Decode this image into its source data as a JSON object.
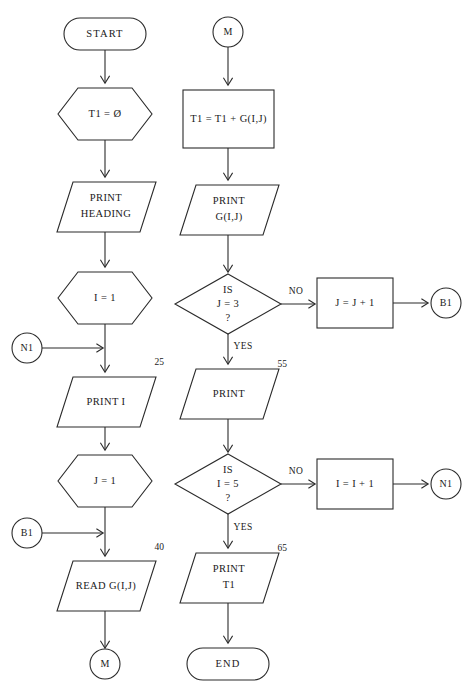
{
  "diagram": {
    "type": "flowchart",
    "title": "",
    "orientation": "two-column",
    "colors": {
      "stroke": "#2b2b2b",
      "fill": "#ffffff",
      "text": "#1a1a1a",
      "background": "#ffffff"
    }
  },
  "nodes": {
    "start": {
      "label": "START",
      "shape": "terminator"
    },
    "init_t1": {
      "label": "T1 = Ø",
      "shape": "preparation-hexagon"
    },
    "print_heading": {
      "line1": "PRINT",
      "line2": "HEADING",
      "shape": "parallelogram-io"
    },
    "init_i": {
      "label": "I = 1",
      "shape": "preparation-hexagon"
    },
    "conn_n1_left": {
      "label": "N1",
      "shape": "connector-circle"
    },
    "print_i": {
      "label": "PRINT I",
      "shape": "parallelogram-io",
      "step": "25"
    },
    "init_j": {
      "label": "J = 1",
      "shape": "preparation-hexagon"
    },
    "conn_b1_left": {
      "label": "B1",
      "shape": "connector-circle"
    },
    "read_g": {
      "label": "READ G(I,J)",
      "shape": "parallelogram-io",
      "step": "40"
    },
    "conn_m_bottom": {
      "label": "M",
      "shape": "connector-circle"
    },
    "conn_m_top": {
      "label": "M",
      "shape": "connector-circle"
    },
    "accumulate": {
      "label": "T1 = T1 + G(I,J)",
      "shape": "process-rectangle"
    },
    "print_g": {
      "line1": "PRINT",
      "line2": "G(I,J)",
      "shape": "parallelogram-io"
    },
    "decide_j": {
      "line1": "IS",
      "line2": "J = 3",
      "line3": "?",
      "shape": "decision-diamond"
    },
    "incr_j": {
      "label": "J = J + 1",
      "shape": "process-rectangle"
    },
    "conn_b1_right": {
      "label": "B1",
      "shape": "connector-circle"
    },
    "print_blank": {
      "label": "PRINT",
      "shape": "parallelogram-io",
      "step": "55"
    },
    "decide_i": {
      "line1": "IS",
      "line2": "I = 5",
      "line3": "?",
      "shape": "decision-diamond"
    },
    "incr_i": {
      "label": "I = I + 1",
      "shape": "process-rectangle"
    },
    "conn_n1_right": {
      "label": "N1",
      "shape": "connector-circle"
    },
    "print_t1": {
      "line1": "PRINT",
      "line2": "T1",
      "shape": "parallelogram-io",
      "step": "65"
    },
    "end": {
      "label": "END",
      "shape": "terminator"
    }
  },
  "edge_labels": {
    "j_no": "NO",
    "j_yes": "YES",
    "i_no": "NO",
    "i_yes": "YES"
  },
  "step_numbers": {
    "print_i": "25",
    "read_g": "40",
    "print_blank": "55",
    "print_t1": "65"
  }
}
